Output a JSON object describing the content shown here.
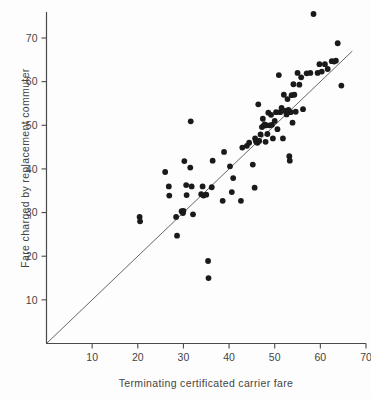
{
  "chart_data": {
    "type": "scatter",
    "title": "",
    "xlabel": "Terminating certificated carrier fare",
    "ylabel": "Fare charged by replacement commuter",
    "xlim": [
      0,
      70
    ],
    "ylim": [
      0,
      78
    ],
    "xticks": [
      10,
      20,
      30,
      40,
      50,
      60,
      70
    ],
    "yticks": [
      10,
      20,
      30,
      40,
      50,
      60,
      70
    ],
    "xtick_labels": [
      "10",
      "20",
      "30",
      "40",
      "50",
      "60",
      "70"
    ],
    "ytick_labels": [
      "10",
      "20",
      "30",
      "40",
      "50",
      "60",
      "70"
    ],
    "grid": false,
    "legend": null,
    "marker": "filled-circle",
    "marker_color": "#1a1a1a",
    "marker_size": 5,
    "reference_line": {
      "label": "identity line y = x",
      "type": "line",
      "x": [
        0,
        67
      ],
      "y": [
        0,
        67
      ],
      "color": "#555555",
      "width": 0.9
    },
    "points": [
      [
        20.4,
        29.0
      ],
      [
        20.5,
        28.0
      ],
      [
        26.0,
        39.3
      ],
      [
        26.8,
        36.0
      ],
      [
        26.9,
        33.9
      ],
      [
        28.4,
        29.0
      ],
      [
        28.6,
        24.7
      ],
      [
        29.6,
        30.3
      ],
      [
        29.9,
        29.9
      ],
      [
        30.0,
        30.4
      ],
      [
        30.2,
        41.8
      ],
      [
        30.6,
        36.3
      ],
      [
        30.7,
        34.0
      ],
      [
        31.5,
        40.3
      ],
      [
        31.6,
        50.9
      ],
      [
        31.8,
        36.0
      ],
      [
        32.1,
        29.6
      ],
      [
        33.9,
        34.2
      ],
      [
        34.2,
        36.0
      ],
      [
        34.4,
        33.9
      ],
      [
        35.0,
        34.1
      ],
      [
        35.4,
        18.9
      ],
      [
        35.5,
        15.0
      ],
      [
        36.2,
        35.8
      ],
      [
        36.4,
        41.9
      ],
      [
        38.6,
        32.7
      ],
      [
        38.9,
        43.9
      ],
      [
        40.2,
        40.6
      ],
      [
        40.6,
        34.7
      ],
      [
        40.9,
        37.9
      ],
      [
        42.6,
        32.7
      ],
      [
        42.9,
        44.9
      ],
      [
        43.9,
        45.3
      ],
      [
        44.4,
        46.0
      ],
      [
        45.2,
        41.0
      ],
      [
        45.6,
        35.7
      ],
      [
        45.7,
        47.0
      ],
      [
        45.9,
        46.3
      ],
      [
        46.2,
        46.0
      ],
      [
        46.4,
        54.8
      ],
      [
        46.6,
        46.4
      ],
      [
        46.9,
        47.9
      ],
      [
        47.2,
        49.6
      ],
      [
        47.4,
        51.5
      ],
      [
        47.6,
        49.9
      ],
      [
        47.8,
        50.2
      ],
      [
        48.0,
        46.2
      ],
      [
        48.2,
        50.0
      ],
      [
        48.4,
        48.0
      ],
      [
        48.6,
        52.9
      ],
      [
        48.9,
        50.0
      ],
      [
        49.2,
        52.4
      ],
      [
        49.4,
        50.1
      ],
      [
        49.6,
        47.0
      ],
      [
        50.0,
        51.0
      ],
      [
        50.3,
        53.0
      ],
      [
        50.6,
        49.1
      ],
      [
        50.9,
        61.5
      ],
      [
        51.2,
        53.0
      ],
      [
        51.5,
        54.0
      ],
      [
        51.8,
        47.0
      ],
      [
        52.0,
        57.0
      ],
      [
        52.3,
        53.3
      ],
      [
        52.6,
        52.5
      ],
      [
        52.8,
        56.0
      ],
      [
        53.0,
        53.5
      ],
      [
        53.2,
        42.9
      ],
      [
        53.3,
        41.9
      ],
      [
        53.5,
        53.0
      ],
      [
        53.7,
        56.9
      ],
      [
        53.9,
        50.6
      ],
      [
        54.1,
        59.4
      ],
      [
        54.3,
        57.0
      ],
      [
        54.6,
        53.1
      ],
      [
        55.0,
        62.0
      ],
      [
        55.4,
        59.3
      ],
      [
        55.8,
        61.0
      ],
      [
        56.2,
        53.7
      ],
      [
        57.0,
        61.9
      ],
      [
        57.8,
        62.0
      ],
      [
        58.5,
        75.5
      ],
      [
        59.4,
        62.0
      ],
      [
        59.8,
        64.0
      ],
      [
        60.3,
        62.3
      ],
      [
        61.0,
        64.0
      ],
      [
        61.6,
        62.9
      ],
      [
        62.5,
        64.7
      ],
      [
        63.0,
        64.6
      ],
      [
        63.4,
        64.8
      ],
      [
        63.8,
        68.8
      ],
      [
        64.6,
        59.1
      ]
    ]
  },
  "axes": {
    "x_axis_name": "x-axis",
    "y_axis_name": "y-axis"
  }
}
